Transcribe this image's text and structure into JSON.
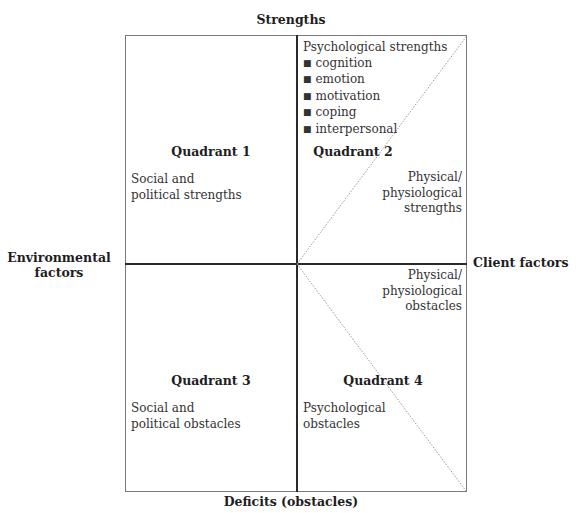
{
  "axes": {
    "top": "Strengths",
    "bottom": "Deficits (obstacles)",
    "left": "Environmental factors",
    "left_lines": [
      "Environmental",
      "factors"
    ],
    "right": "Client factors"
  },
  "quadrants": [
    {
      "title": "Quadrant 1",
      "position": "top-left",
      "text_lines": [
        "Social and",
        "political strengths"
      ]
    },
    {
      "title": "Quadrant 2",
      "position": "top-right",
      "header": "Psychological strengths",
      "bullets": [
        "cognition",
        "emotion",
        "motivation",
        "coping",
        "interpersonal"
      ],
      "text_lines": [
        "Physical/",
        "physiological",
        "strengths"
      ]
    },
    {
      "title": "Quadrant 3",
      "position": "bottom-left",
      "text_lines": [
        "Social and",
        "political obstacles"
      ]
    },
    {
      "title": "Quadrant 4",
      "position": "bottom-right",
      "top_text_lines": [
        "Physical/",
        "physiological",
        "obstacles"
      ],
      "text_lines": [
        "Psychological",
        "obstacles"
      ]
    }
  ],
  "colors": {
    "border": "#7a7a7a",
    "divider": "#2a2a2a",
    "diagonal": "#9a9a9a"
  }
}
